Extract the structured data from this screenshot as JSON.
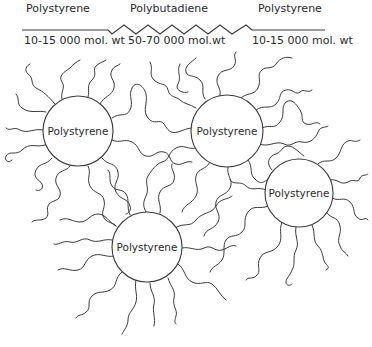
{
  "header": {
    "segments": [
      {
        "name": "Polystyrene",
        "mol_wt": "10-15 000 mol. wt"
      },
      {
        "name": "Polybutadiene",
        "mol_wt": "50-70 000 mol.wt"
      },
      {
        "name": "Polystyrene",
        "mol_wt": "10-15 000 mol. wt"
      }
    ]
  },
  "domains": [
    {
      "label": "Polystyrene"
    },
    {
      "label": "Polystyrene"
    },
    {
      "label": "Polystyrene"
    },
    {
      "label": "Polystyrene"
    }
  ],
  "colors": {
    "line": "#3a3a3a",
    "text": "#2a2a2a",
    "background": "#ffffff"
  }
}
